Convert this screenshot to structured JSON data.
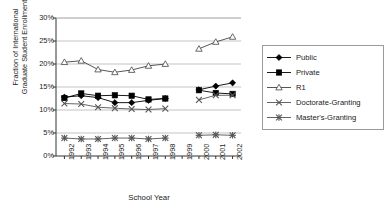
{
  "chart_data": {
    "type": "line",
    "title": "",
    "xlabel": "School Year",
    "ylabel": "Fraction of International\nGraduate Student Enrollment",
    "categories": [
      "1992",
      "1993",
      "1994",
      "1995",
      "1996",
      "1997",
      "1998",
      "1999",
      "2000",
      "2001",
      "2002"
    ],
    "x": [
      1992,
      1993,
      1994,
      1995,
      1996,
      1997,
      1998,
      1999,
      2000,
      2001,
      2002
    ],
    "ylim": [
      0,
      30
    ],
    "yticks": [
      "0%",
      "5%",
      "10%",
      "15%",
      "20%",
      "25%",
      "30%"
    ],
    "ytick_values": [
      0,
      5,
      10,
      15,
      20,
      25,
      30
    ],
    "grid": "horizontal",
    "legend_position": "right",
    "missing_year": "1999",
    "series": [
      {
        "name": "Public",
        "marker": "filled-diamond",
        "color": "#000000",
        "values": [
          12.8,
          13.1,
          12.7,
          11.6,
          11.6,
          12.1,
          12.5,
          null,
          14.4,
          15.2,
          15.9
        ]
      },
      {
        "name": "Private",
        "marker": "filled-square",
        "color": "#000000",
        "values": [
          12.6,
          13.6,
          13.1,
          13.2,
          13.1,
          12.3,
          12.5,
          null,
          14.3,
          13.7,
          13.5
        ]
      },
      {
        "name": "R1",
        "marker": "open-triangle",
        "color": "#444444",
        "values": [
          20.4,
          20.7,
          18.8,
          18.2,
          18.7,
          19.6,
          20.0,
          null,
          23.3,
          24.8,
          25.9
        ]
      },
      {
        "name": "Doctorate-Granting",
        "marker": "cross-x",
        "color": "#555555",
        "values": [
          11.4,
          11.3,
          10.6,
          10.4,
          10.2,
          10.1,
          10.3,
          null,
          12.2,
          13.2,
          13.2
        ]
      },
      {
        "name": "Master's-Granting",
        "marker": "asterisk",
        "color": "#555555",
        "values": [
          3.9,
          3.7,
          3.7,
          3.9,
          3.9,
          3.7,
          3.9,
          null,
          4.5,
          4.6,
          4.5
        ]
      }
    ]
  },
  "legend": {
    "items": [
      {
        "label": "Public",
        "marker": "filled-diamond"
      },
      {
        "label": "Private",
        "marker": "filled-square"
      },
      {
        "label": "R1",
        "marker": "open-triangle"
      },
      {
        "label": "Doctorate-Granting",
        "marker": "cross-x"
      },
      {
        "label": "Master's-Granting",
        "marker": "asterisk"
      }
    ]
  }
}
